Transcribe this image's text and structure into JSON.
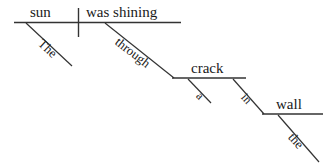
{
  "diagram": {
    "type": "sentence-diagram",
    "sentence": "The sun was shining through a crack in the wall.",
    "stroke_color": "#333333",
    "text_color": "#1a1a1a",
    "background_color": "#ffffff",
    "words": {
      "subject": "sun",
      "subject_article": "The",
      "predicate": "was shining",
      "preposition_1": "through",
      "object_1": "crack",
      "object_1_article": "a",
      "preposition_2": "in",
      "object_2": "wall",
      "object_2_article": "the"
    },
    "lines": {
      "main_baseline": "sun / was shining baseline",
      "subject_verb_divider": "vertical divider",
      "article_the_slant": "The",
      "through_slant": "through",
      "crack_baseline": "crack baseline",
      "a_slant": "a",
      "in_slant": "in",
      "wall_baseline": "wall baseline",
      "the_slant": "the"
    }
  }
}
